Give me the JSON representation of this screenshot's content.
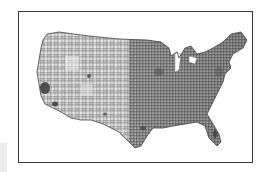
{
  "figure": {
    "type": "choropleth-map",
    "color_scheme": "grayscale",
    "colors": {
      "frame_border": "#3a3a3a",
      "background": "#ffffff",
      "land_light": "#d8d8d8",
      "land_mid": "#8a8a8a",
      "land_dark": "#3c3c3c",
      "county_lines": "#555555"
    },
    "labels": []
  }
}
